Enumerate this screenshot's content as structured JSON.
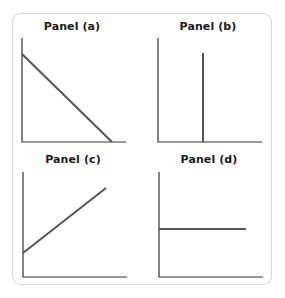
{
  "chart_data": [
    {
      "type": "line",
      "title": "Panel (a)",
      "description": "Downward-sloping straight line from y-axis to x-axis",
      "xlabel": "",
      "ylabel": "",
      "geometry": {
        "axis_origin": [
          22,
          142
        ],
        "axis_x_end": 126,
        "axis_y_top": 38,
        "line": [
          [
            22,
            54
          ],
          [
            112,
            142
          ]
        ]
      }
    },
    {
      "type": "line",
      "title": "Panel (b)",
      "description": "Vertical line",
      "xlabel": "",
      "ylabel": "",
      "geometry": {
        "axis_origin": [
          158,
          142
        ],
        "axis_x_end": 262,
        "axis_y_top": 38,
        "line": [
          [
            203,
            53
          ],
          [
            203,
            142
          ]
        ]
      }
    },
    {
      "type": "line",
      "title": "Panel (c)",
      "description": "Upward-sloping straight line with positive intercept",
      "xlabel": "",
      "ylabel": "",
      "geometry": {
        "axis_origin": [
          23,
          277
        ],
        "axis_x_end": 127,
        "axis_y_top": 172,
        "line": [
          [
            23,
            253
          ],
          [
            106,
            188
          ]
        ]
      }
    },
    {
      "type": "line",
      "title": "Panel (d)",
      "description": "Horizontal line",
      "xlabel": "",
      "ylabel": "",
      "geometry": {
        "axis_origin": [
          159,
          277
        ],
        "axis_x_end": 263,
        "axis_y_top": 172,
        "line": [
          [
            159,
            229
          ],
          [
            246,
            229
          ]
        ]
      }
    }
  ],
  "panels": [
    {
      "title": "Panel (a)"
    },
    {
      "title": "Panel (b)"
    },
    {
      "title": "Panel (c)"
    },
    {
      "title": "Panel (d)"
    }
  ],
  "colors": {
    "axis": "#333333",
    "line": "#555555",
    "frame": "#d6d6d6"
  }
}
